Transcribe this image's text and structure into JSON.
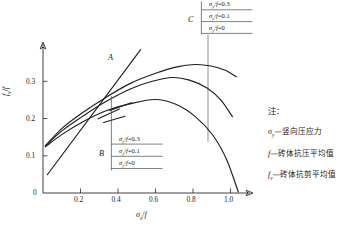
{
  "chart_data": {
    "type": "line",
    "title": "",
    "xlabel": "σx/f",
    "ylabel": "fv/f",
    "xlim": [
      0,
      1.06
    ],
    "ylim": [
      0,
      0.4
    ],
    "grid": false,
    "legend_position": "callout-boxes",
    "xticks": [
      "0.2",
      "0.4",
      "0.6",
      "0.8",
      "1.0"
    ],
    "xtick_values": [
      0.2,
      0.4,
      0.6,
      0.8,
      1.0
    ],
    "yticks": [
      "0",
      "0.1",
      "0.2",
      "0.3"
    ],
    "ytick_values": [
      0,
      0.1,
      0.2,
      0.3
    ],
    "origin_label": "0",
    "series": [
      {
        "name": "A",
        "kind": "straight",
        "label": "A",
        "points": [
          [
            0.022,
            0.049
          ],
          [
            0.5,
            0.385
          ]
        ]
      },
      {
        "name": "σy/f=0.3",
        "kind": "curve",
        "sigma_ratio": 0.3,
        "peak": [
          0.78,
          0.345
        ],
        "points": [
          [
            0.012,
            0.127
          ],
          [
            0.1,
            0.175
          ],
          [
            0.2,
            0.215
          ],
          [
            0.32,
            0.256
          ],
          [
            0.45,
            0.295
          ],
          [
            0.58,
            0.322
          ],
          [
            0.68,
            0.338
          ],
          [
            0.78,
            0.345
          ],
          [
            0.86,
            0.341
          ],
          [
            0.93,
            0.33
          ],
          [
            0.99,
            0.312
          ]
        ]
      },
      {
        "name": "σy/f=0.1",
        "kind": "curve",
        "sigma_ratio": 0.1,
        "peak": [
          0.665,
          0.31
        ],
        "points": [
          [
            0.012,
            0.126
          ],
          [
            0.1,
            0.168
          ],
          [
            0.2,
            0.205
          ],
          [
            0.32,
            0.245
          ],
          [
            0.45,
            0.28
          ],
          [
            0.56,
            0.3
          ],
          [
            0.665,
            0.31
          ],
          [
            0.75,
            0.303
          ],
          [
            0.84,
            0.282
          ],
          [
            0.91,
            0.25
          ],
          [
            0.97,
            0.205
          ]
        ]
      },
      {
        "name": "σy/f=0",
        "kind": "curve",
        "sigma_ratio": 0.0,
        "peak": [
          0.575,
          0.251
        ],
        "points": [
          [
            0.012,
            0.124
          ],
          [
            0.1,
            0.158
          ],
          [
            0.2,
            0.19
          ],
          [
            0.32,
            0.22
          ],
          [
            0.45,
            0.24
          ],
          [
            0.575,
            0.251
          ],
          [
            0.68,
            0.238
          ],
          [
            0.78,
            0.205
          ],
          [
            0.87,
            0.155
          ],
          [
            0.94,
            0.09
          ],
          [
            1.0,
            0.003
          ]
        ]
      }
    ],
    "vertical_reference_line": {
      "x": 0.845,
      "y_top": 0.425,
      "y_bottom": 0.138
    },
    "annotations": [
      {
        "label": "A",
        "x": 0.325,
        "y": 0.325
      },
      {
        "label": "B",
        "x": 0.285,
        "y": 0.112
      },
      {
        "label": "C",
        "x": 0.755,
        "y": 0.408
      }
    ]
  },
  "callouts": {
    "group_b": {
      "label": "B",
      "rows": [
        {
          "sym": "σ",
          "sub": "y",
          "slash": "/",
          "den": "f",
          "eq": "=0.3"
        },
        {
          "sym": "σ",
          "sub": "y",
          "slash": "/",
          "den": "f",
          "eq": "=0.1"
        },
        {
          "sym": "σ",
          "sub": "y",
          "slash": "/",
          "den": "f",
          "eq": "=0"
        }
      ],
      "row_texts": [
        "σy/f=0.3",
        "σy/f=0.1",
        "σy/f=0"
      ]
    },
    "group_c": {
      "label": "C",
      "rows": [
        {
          "sym": "σ",
          "sub": "y",
          "slash": "/",
          "den": "f",
          "eq": "=0.3"
        },
        {
          "sym": "σ",
          "sub": "y",
          "slash": "/",
          "den": "f",
          "eq": "=0.1"
        },
        {
          "sym": "σ",
          "sub": "y",
          "slash": "/",
          "den": "f",
          "eq": "=0"
        }
      ],
      "row_texts": [
        "σy/f=0.3",
        "σy/f=0.1",
        "σy/f=0"
      ]
    }
  },
  "notes": {
    "heading": "注：",
    "items": [
      {
        "sym": "σ",
        "sub": "y",
        "text": "—竖向压应力"
      },
      {
        "sym": "f",
        "sub": "",
        "text": "—砖体抗压平均值"
      },
      {
        "sym": "f",
        "sub": "v",
        "text": "—砖体抗剪平均值"
      }
    ]
  },
  "axis": {
    "x_title": {
      "sym": "σ",
      "sub": "x",
      "slash": "/",
      "den": "f"
    },
    "y_title": {
      "sym": "f",
      "sub": "v",
      "slash": "/",
      "den": "f"
    }
  },
  "colors": {
    "curve": "#1e1e1e",
    "axis": "#2b2b2b",
    "leader": "#4a4a4a",
    "background": "#ffffff"
  }
}
